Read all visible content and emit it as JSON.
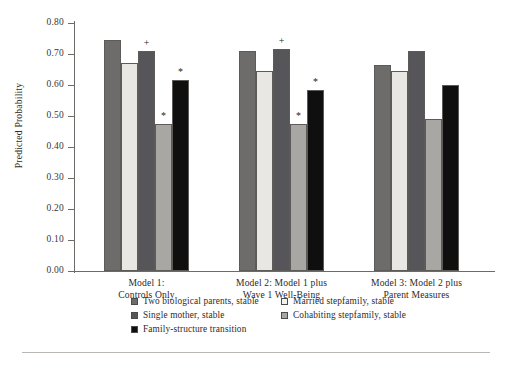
{
  "chart_data": {
    "type": "bar",
    "title": "",
    "xlabel": "",
    "ylabel": "Predicted Probability",
    "ylim": [
      0.0,
      0.8
    ],
    "ytick_labels": [
      "0.80",
      "0.70",
      "0.60",
      "0.50",
      "0.40",
      "0.30",
      "0.20",
      "0.10",
      "0.00"
    ],
    "ytick_values": [
      0.8,
      0.7,
      0.6,
      0.5,
      0.4,
      0.3,
      0.2,
      0.1,
      0.0
    ],
    "grid": false,
    "legend_position": "bottom",
    "categories": [
      "Model 1:\nControls Only",
      "Model 2: Model 1 plus\nWave 1 Well-Being",
      "Model 3: Model 2 plus\nParent Measures"
    ],
    "category_lines": [
      [
        "Model 1:",
        "Controls Only"
      ],
      [
        "Model 2: Model 1 plus",
        "Wave 1 Well-Being"
      ],
      [
        "Model 3: Model 2 plus",
        "Parent Measures"
      ]
    ],
    "series": [
      {
        "name": "Two biological parents, stable",
        "color": "#6e6c6b",
        "values": [
          0.745,
          0.71,
          0.665
        ],
        "annotations": [
          "",
          "",
          ""
        ]
      },
      {
        "name": "Married stepfamily, stable",
        "color": "#e8e7e3",
        "values": [
          0.67,
          0.645,
          0.645
        ],
        "annotations": [
          "",
          "",
          ""
        ]
      },
      {
        "name": "Single mother, stable",
        "color": "#56565a",
        "values": [
          0.71,
          0.715,
          0.71
        ],
        "annotations": [
          "+",
          "+",
          ""
        ]
      },
      {
        "name": "Cohabiting stepfamily, stable",
        "color": "#a8a7a4",
        "values": [
          0.475,
          0.475,
          0.49
        ],
        "annotations": [
          "*",
          "*",
          ""
        ]
      },
      {
        "name": "Family-structure transition",
        "color": "#100f10",
        "values": [
          0.615,
          0.585,
          0.6
        ],
        "annotations": [
          "*",
          "*",
          ""
        ]
      }
    ]
  },
  "legend": {
    "rows": [
      [
        {
          "label": "Two biological parents, stable",
          "color": "#6e6c6b"
        },
        {
          "label": "Married stepfamily, stable",
          "color": "#f2f1ee"
        }
      ],
      [
        {
          "label": "Single mother, stable",
          "color": "#56565a"
        },
        {
          "label": "Cohabiting stepfamily, stable",
          "color": "#a8a7a4"
        }
      ],
      [
        {
          "label": "Family-structure transition",
          "color": "#100f10"
        }
      ]
    ]
  }
}
